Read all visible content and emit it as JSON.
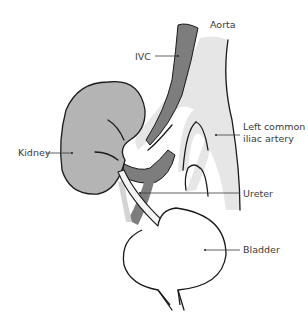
{
  "diagram": {
    "labels": {
      "aorta": "Aorta",
      "ivc": "IVC",
      "left_common_iliac_line1": "Left common",
      "left_common_iliac_line2": "iliac artery",
      "kidney": "Kidney",
      "ureter": "Ureter",
      "bladder": "Bladder"
    },
    "colors": {
      "background": "#ffffff",
      "kidney_fill": "#b4b4b4",
      "vein_fill": "#7d7d7d",
      "artery_fill": "#e6e6e6",
      "ureter_fill": "#f4f4f4",
      "bladder_fill": "#ffffff",
      "outline": "#1a1a1a",
      "label_text": "#3a3a3a"
    }
  }
}
